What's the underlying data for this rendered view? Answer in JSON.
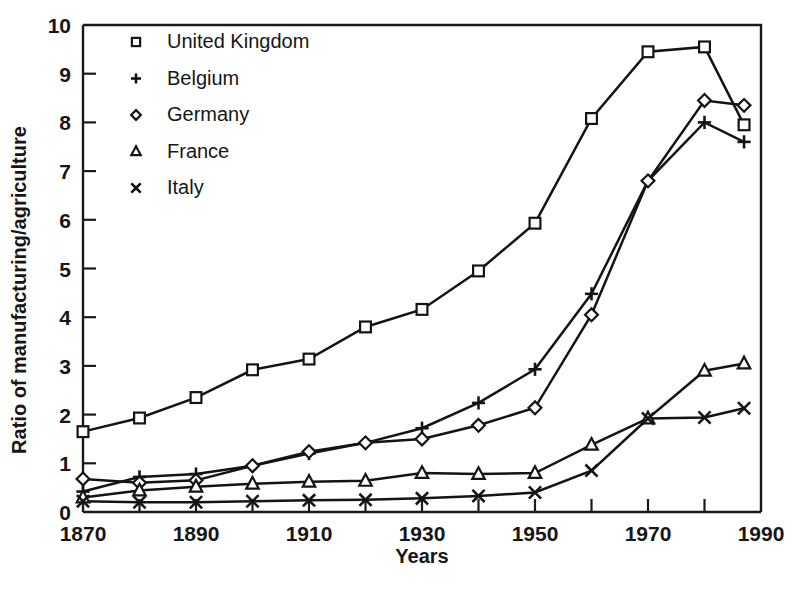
{
  "chart_data": {
    "type": "line",
    "title": "",
    "xlabel": "Years",
    "ylabel": "Ratio of manufacturing/agriculture",
    "xlim": [
      1870,
      1990
    ],
    "ylim": [
      0,
      10
    ],
    "xticks": [
      1870,
      1880,
      1890,
      1900,
      1910,
      1920,
      1930,
      1940,
      1950,
      1960,
      1970,
      1980,
      1990
    ],
    "xtick_labels": [
      "1870",
      "",
      "1890",
      "",
      "1910",
      "",
      "1930",
      "",
      "1950",
      "",
      "1970",
      "",
      "1990"
    ],
    "yticks": [
      0,
      1,
      2,
      3,
      4,
      5,
      6,
      7,
      8,
      9,
      10
    ],
    "ytick_labels": [
      "0",
      "1",
      "2",
      "3",
      "4",
      "5",
      "6",
      "7",
      "8",
      "9",
      "10"
    ],
    "grid": false,
    "legend_position": "upper-left-inside",
    "series": [
      {
        "name": "United Kingdom",
        "marker": "square",
        "x": [
          1870,
          1880,
          1890,
          1900,
          1910,
          1920,
          1930,
          1940,
          1950,
          1960,
          1970,
          1980,
          1987
        ],
        "values": [
          1.65,
          1.93,
          2.35,
          2.92,
          3.14,
          3.8,
          4.16,
          4.95,
          5.93,
          8.08,
          9.45,
          9.55,
          7.95
        ]
      },
      {
        "name": "Belgium",
        "marker": "plus",
        "x": [
          1870,
          1880,
          1890,
          1900,
          1910,
          1920,
          1930,
          1940,
          1950,
          1960,
          1970,
          1980,
          1987
        ],
        "values": [
          0.42,
          0.72,
          0.78,
          0.95,
          1.2,
          1.42,
          1.72,
          2.24,
          2.93,
          4.48,
          6.8,
          8.0,
          7.6
        ]
      },
      {
        "name": "Germany",
        "marker": "diamond",
        "x": [
          1870,
          1880,
          1890,
          1900,
          1910,
          1920,
          1930,
          1940,
          1950,
          1960,
          1970,
          1980,
          1987
        ],
        "values": [
          0.68,
          0.6,
          0.65,
          0.95,
          1.24,
          1.42,
          1.5,
          1.78,
          2.14,
          4.05,
          6.8,
          8.45,
          8.35
        ]
      },
      {
        "name": "France",
        "marker": "triangle",
        "x": [
          1870,
          1880,
          1890,
          1900,
          1910,
          1920,
          1930,
          1940,
          1950,
          1960,
          1970,
          1980,
          1987
        ],
        "values": [
          0.3,
          0.44,
          0.52,
          0.58,
          0.62,
          0.64,
          0.8,
          0.78,
          0.8,
          1.38,
          1.92,
          2.9,
          3.05
        ]
      },
      {
        "name": "Italy",
        "marker": "cross",
        "x": [
          1870,
          1880,
          1890,
          1900,
          1910,
          1920,
          1930,
          1940,
          1950,
          1960,
          1970,
          1980,
          1987
        ],
        "values": [
          0.22,
          0.2,
          0.2,
          0.22,
          0.24,
          0.25,
          0.28,
          0.33,
          0.4,
          0.85,
          1.92,
          1.94,
          2.13
        ]
      }
    ],
    "legend": [
      {
        "label": "United Kingdom",
        "marker": "square"
      },
      {
        "label": "Belgium",
        "marker": "plus"
      },
      {
        "label": "Germany",
        "marker": "diamond"
      },
      {
        "label": "France",
        "marker": "triangle"
      },
      {
        "label": "Italy",
        "marker": "cross"
      }
    ]
  },
  "axes": {
    "xlabel": "Years",
    "ylabel": "Ratio of manufacturing/agriculture"
  }
}
